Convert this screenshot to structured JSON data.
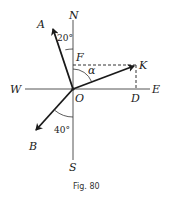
{
  "figure": {
    "caption": "Fig. 80",
    "compass": {
      "north": "N",
      "south": "S",
      "east": "E",
      "west": "W"
    },
    "origin": "O",
    "points": {
      "A": "A",
      "B": "B",
      "K": "K",
      "F": "F",
      "D": "D"
    },
    "angles": {
      "A_from_north": "20°",
      "B_from_south": "40°",
      "K_from_north": "α"
    },
    "vectors": [
      {
        "name": "OA",
        "bearing_deg": -20
      },
      {
        "name": "OK",
        "label": "K"
      },
      {
        "name": "OB",
        "bearing_deg": 220
      }
    ]
  }
}
